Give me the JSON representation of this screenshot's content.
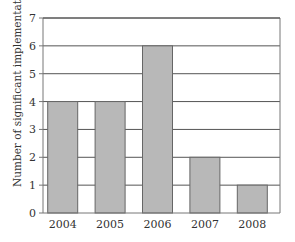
{
  "chart_data": {
    "type": "bar",
    "title": "",
    "xlabel": "",
    "ylabel": "Number of significant implementations",
    "categories": [
      "2004",
      "2005",
      "2006",
      "2007",
      "2008"
    ],
    "values": [
      4,
      4,
      6,
      2,
      1
    ],
    "ylim": [
      0,
      7
    ],
    "yticks": [
      0,
      1,
      2,
      3,
      4,
      5,
      6,
      7
    ],
    "grid": true,
    "legend": null,
    "colors": {
      "bar": "#b8b8b8",
      "bar_border": "#666666",
      "grid": "#555555",
      "axis": "#777777"
    }
  }
}
